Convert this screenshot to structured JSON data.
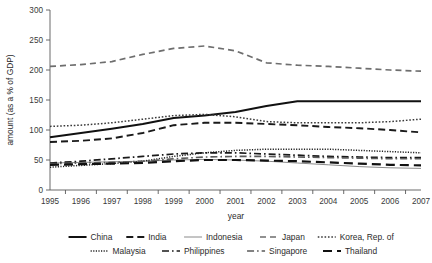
{
  "chart_data": {
    "type": "line",
    "title": "",
    "xlabel": "year",
    "ylabel": "amount (as a % of GDP)",
    "x": [
      1995,
      1996,
      1997,
      1998,
      1999,
      2000,
      2001,
      2002,
      2003,
      2004,
      2005,
      2006,
      2007
    ],
    "xtick_labels": [
      "1995",
      "1996",
      "1997",
      "1998",
      "1999",
      "2000",
      "2001",
      "2002",
      "2003",
      "2004",
      "2005",
      "2006",
      "2007"
    ],
    "ytick_labels": [
      "0",
      "50",
      "100",
      "150",
      "200",
      "250",
      "300"
    ],
    "yticks": [
      0,
      50,
      100,
      150,
      200,
      250,
      300
    ],
    "ylim": [
      0,
      300
    ],
    "grid": false,
    "legend_position": "bottom",
    "series": [
      {
        "name": "China",
        "style": "solid-thick",
        "color": "#111111",
        "values": [
          88,
          95,
          102,
          110,
          120,
          124,
          130,
          140,
          148,
          148,
          148,
          148,
          148
        ]
      },
      {
        "name": "India",
        "style": "dashed",
        "color": "#1a1a1a",
        "values": [
          80,
          82,
          86,
          95,
          108,
          112,
          112,
          110,
          108,
          105,
          103,
          100,
          96
        ]
      },
      {
        "name": "Indonesia",
        "style": "solid-thin",
        "color": "#8a8a8a",
        "values": [
          45,
          46,
          47,
          48,
          50,
          51,
          50,
          48,
          45,
          42,
          39,
          37,
          36
        ]
      },
      {
        "name": "Japan",
        "style": "long-dash",
        "color": "#6e6e6e",
        "values": [
          206,
          209,
          214,
          226,
          236,
          240,
          232,
          212,
          208,
          206,
          203,
          200,
          198
        ]
      },
      {
        "name": "Korea, Rep. of",
        "style": "dotted",
        "color": "#3a3a3a",
        "values": [
          106,
          108,
          112,
          118,
          124,
          126,
          122,
          114,
          112,
          112,
          112,
          114,
          118
        ]
      },
      {
        "name": "Malaysia",
        "style": "fine-dotted",
        "color": "#222222",
        "values": [
          38,
          41,
          44,
          48,
          56,
          62,
          66,
          68,
          68,
          68,
          66,
          64,
          62
        ]
      },
      {
        "name": "Philippines",
        "style": "dash-dot",
        "color": "#1a1a1a",
        "values": [
          45,
          48,
          52,
          56,
          60,
          62,
          62,
          60,
          58,
          56,
          55,
          54,
          54
        ]
      },
      {
        "name": "Singapore",
        "style": "dash-dot-gray",
        "color": "#5a5a5a",
        "values": [
          44,
          45,
          46,
          48,
          52,
          55,
          56,
          56,
          55,
          54,
          53,
          52,
          52
        ]
      },
      {
        "name": "Thailand",
        "style": "long-dash-thick",
        "color": "#111111",
        "values": [
          42,
          43,
          44,
          45,
          48,
          50,
          50,
          49,
          48,
          46,
          44,
          42,
          41
        ]
      }
    ]
  },
  "legend": {
    "row1": [
      "China",
      "India",
      "Indonesia",
      "Japan",
      "Korea, Rep. of"
    ],
    "row2": [
      "Malaysia",
      "Philippines",
      "Singapore",
      "Thailand"
    ]
  }
}
